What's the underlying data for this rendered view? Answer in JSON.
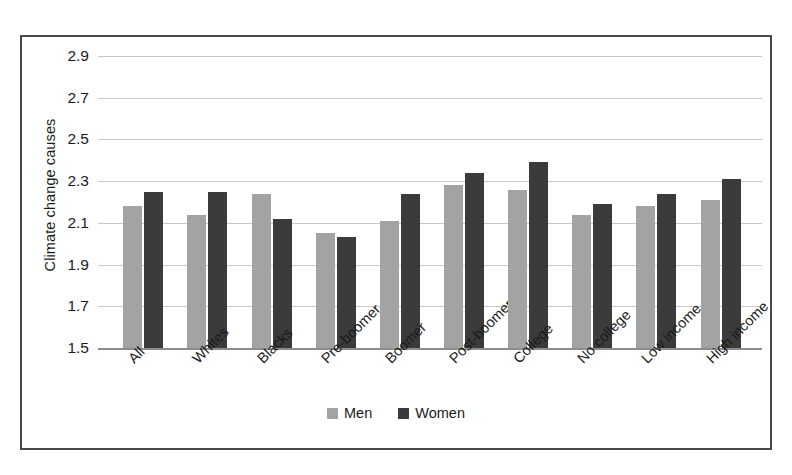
{
  "chart_data": {
    "type": "bar",
    "title": "",
    "xlabel": "",
    "ylabel": "Climate change causes",
    "ylim": [
      1.5,
      2.9
    ],
    "ytick_step": 0.2,
    "yticks": [
      "2.9",
      "2.7",
      "2.5",
      "2.3",
      "2.1",
      "1.9",
      "1.7",
      "1.5"
    ],
    "grid": true,
    "legend_position": "bottom-center",
    "categories": [
      "All",
      "Whites",
      "Blacks",
      "Pre-boomer",
      "Boomer",
      "Post-boomer",
      "College",
      "No college",
      "Low income",
      "High income"
    ],
    "series": [
      {
        "name": "Men",
        "color": "#a3a3a3",
        "values": [
          2.18,
          2.14,
          2.24,
          2.05,
          2.11,
          2.28,
          2.26,
          2.14,
          2.18,
          2.21
        ]
      },
      {
        "name": "Women",
        "color": "#3b3b3b",
        "values": [
          2.25,
          2.25,
          2.12,
          2.03,
          2.24,
          2.34,
          2.39,
          2.19,
          2.24,
          2.31
        ]
      }
    ]
  },
  "legend": {
    "entries": [
      {
        "label": "Men"
      },
      {
        "label": "Women"
      }
    ]
  },
  "colors": {
    "men": "#a3a3a3",
    "women": "#3b3b3b",
    "gridline": "#c9c9c9",
    "frame": "#4a4a4a",
    "text": "#1a1a1a"
  }
}
